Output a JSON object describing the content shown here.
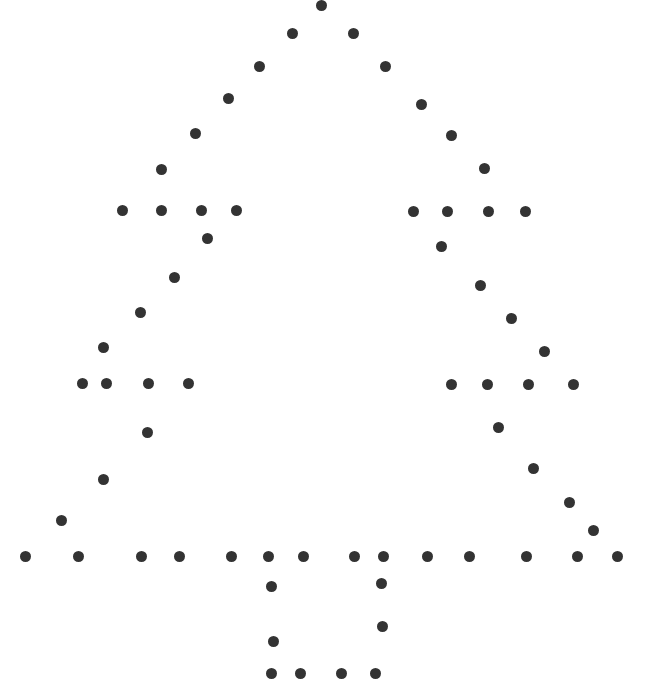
{
  "figure": {
    "width": 665,
    "height": 691,
    "background_color": "#ffffff",
    "dot_color": "#333333",
    "dot_diameter": 11,
    "dot_count": 76
  },
  "chart_data": {
    "type": "scatter",
    "subtitle": "",
    "xlabel": "",
    "ylabel": "",
    "xlim": [
      0,
      665
    ],
    "ylim": [
      0,
      691
    ],
    "grid": false,
    "legend": null,
    "marker": "circle",
    "marker_size": 11,
    "marker_color": "#333333",
    "background_color": "#ffffff",
    "axes_visible": false,
    "tick_labels_x": [],
    "tick_labels_y": [],
    "annotations": [],
    "series": [
      {
        "name": "tree-outline-dots",
        "color": "#333333",
        "points": [
          [
            321,
            5
          ],
          [
            292,
            33
          ],
          [
            353,
            33
          ],
          [
            259,
            66
          ],
          [
            385,
            66
          ],
          [
            228,
            98
          ],
          [
            421,
            104
          ],
          [
            195,
            133
          ],
          [
            451,
            135
          ],
          [
            161,
            169
          ],
          [
            484,
            168
          ],
          [
            122,
            210
          ],
          [
            161,
            210
          ],
          [
            201,
            210
          ],
          [
            236,
            210
          ],
          [
            413,
            211
          ],
          [
            447,
            211
          ],
          [
            488,
            211
          ],
          [
            525,
            211
          ],
          [
            207,
            238
          ],
          [
            441,
            246
          ],
          [
            174,
            277
          ],
          [
            480,
            285
          ],
          [
            140,
            312
          ],
          [
            511,
            318
          ],
          [
            103,
            347
          ],
          [
            544,
            351
          ],
          [
            82,
            383
          ],
          [
            106,
            383
          ],
          [
            148,
            383
          ],
          [
            188,
            383
          ],
          [
            451,
            384
          ],
          [
            487,
            384
          ],
          [
            528,
            384
          ],
          [
            573,
            384
          ],
          [
            147,
            432
          ],
          [
            498,
            427
          ],
          [
            103,
            479
          ],
          [
            533,
            468
          ],
          [
            61,
            520
          ],
          [
            569,
            502
          ],
          [
            593,
            530
          ],
          [
            25,
            556
          ],
          [
            78,
            556
          ],
          [
            141,
            556
          ],
          [
            179,
            556
          ],
          [
            231,
            556
          ],
          [
            268,
            556
          ],
          [
            303,
            556
          ],
          [
            354,
            556
          ],
          [
            383,
            556
          ],
          [
            427,
            556
          ],
          [
            469,
            556
          ],
          [
            526,
            556
          ],
          [
            577,
            556
          ],
          [
            617,
            556
          ],
          [
            271,
            586
          ],
          [
            381,
            583
          ],
          [
            273,
            641
          ],
          [
            382,
            626
          ],
          [
            271,
            673
          ],
          [
            300,
            673
          ],
          [
            341,
            673
          ],
          [
            375,
            673
          ]
        ]
      }
    ]
  }
}
